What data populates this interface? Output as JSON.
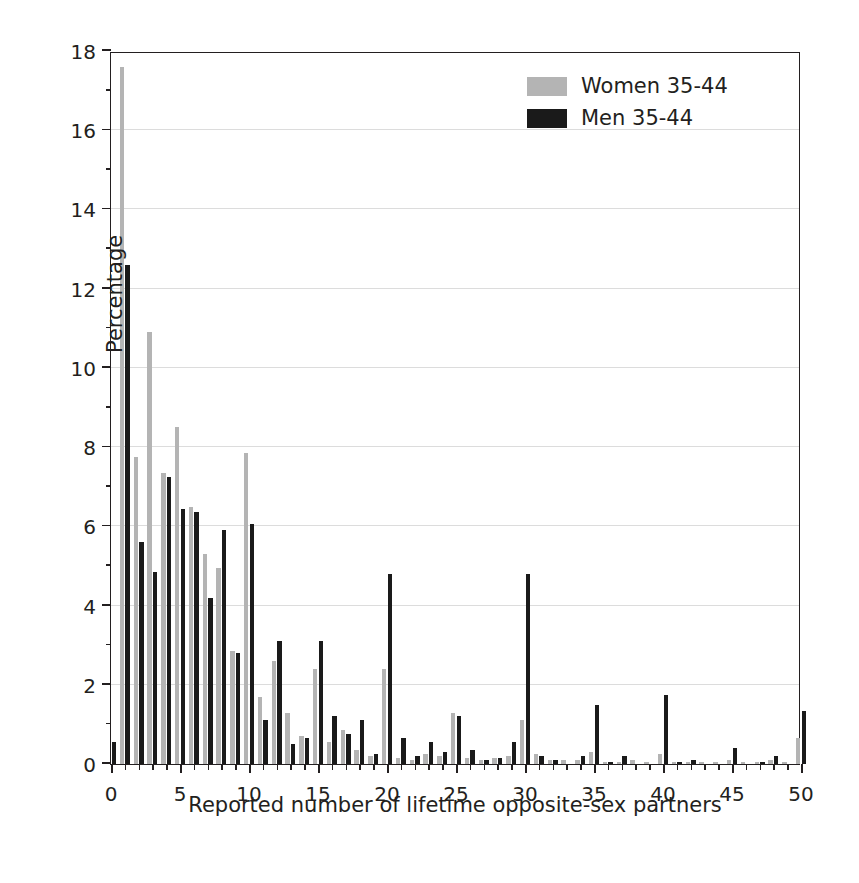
{
  "chart_data": {
    "type": "bar",
    "title": "",
    "xlabel": "Reported number of lifetime opposite-sex partners",
    "ylabel": "Percentage",
    "xlim": [
      0,
      50
    ],
    "ylim": [
      0,
      18
    ],
    "grid": true,
    "legend_position": "top-right",
    "x_major_ticks": [
      0,
      5,
      10,
      15,
      20,
      25,
      30,
      35,
      40,
      45,
      50
    ],
    "x_minor_tick_step": 1,
    "y_major_ticks": [
      0,
      2,
      4,
      6,
      8,
      10,
      12,
      14,
      16,
      18
    ],
    "y_minor_tick_step": 1,
    "colors": {
      "women": "#b4b4b4",
      "men": "#1a1a1a",
      "axis": "#231f20",
      "grid": "#dcdcdc"
    },
    "x": [
      0,
      1,
      2,
      3,
      4,
      5,
      6,
      7,
      8,
      9,
      10,
      11,
      12,
      13,
      14,
      15,
      16,
      17,
      18,
      19,
      20,
      21,
      22,
      23,
      24,
      25,
      26,
      27,
      28,
      29,
      30,
      31,
      32,
      33,
      34,
      35,
      36,
      37,
      38,
      39,
      40,
      41,
      42,
      43,
      44,
      45,
      46,
      47,
      48,
      49,
      50
    ],
    "series": [
      {
        "name": "Women 35-44",
        "color": "#b4b4b4",
        "values": [
          0.0,
          17.6,
          7.75,
          10.9,
          7.35,
          8.5,
          6.5,
          5.3,
          4.95,
          2.85,
          7.85,
          1.7,
          2.6,
          1.3,
          0.7,
          2.4,
          0.55,
          0.85,
          0.35,
          0.2,
          2.4,
          0.15,
          0.1,
          0.25,
          0.2,
          1.3,
          0.15,
          0.1,
          0.15,
          0.2,
          1.1,
          0.25,
          0.1,
          0.1,
          0.1,
          0.3,
          0.05,
          0.05,
          0.1,
          0.05,
          0.25,
          0.05,
          0.05,
          0.05,
          0.05,
          0.1,
          0.05,
          0.05,
          0.1,
          0.05,
          0.65
        ]
      },
      {
        "name": "Men 35-44",
        "color": "#1a1a1a",
        "values": [
          0.55,
          12.6,
          5.6,
          4.85,
          7.25,
          6.45,
          6.35,
          4.2,
          5.9,
          2.8,
          6.05,
          1.1,
          3.1,
          0.5,
          0.65,
          3.1,
          1.2,
          0.75,
          1.1,
          0.25,
          4.8,
          0.65,
          0.2,
          0.55,
          0.3,
          1.2,
          0.35,
          0.1,
          0.15,
          0.55,
          4.8,
          0.2,
          0.1,
          0.0,
          0.2,
          1.5,
          0.05,
          0.2,
          0.0,
          0.0,
          1.75,
          0.05,
          0.1,
          0.0,
          0.0,
          0.4,
          0.0,
          0.05,
          0.2,
          0.0,
          1.35
        ]
      }
    ]
  },
  "legend": {
    "items": [
      {
        "label": "Women 35-44",
        "swatch": "women"
      },
      {
        "label": "Men 35-44",
        "swatch": "men"
      }
    ]
  },
  "axes": {
    "y_title": "Percentage",
    "x_title": "Reported number of lifetime opposite-sex partners",
    "y_tick_labels": [
      "0",
      "2",
      "4",
      "6",
      "8",
      "10",
      "12",
      "14",
      "16",
      "18"
    ],
    "x_tick_labels": [
      "0",
      "5",
      "10",
      "15",
      "20",
      "25",
      "30",
      "35",
      "40",
      "45",
      "50"
    ]
  }
}
